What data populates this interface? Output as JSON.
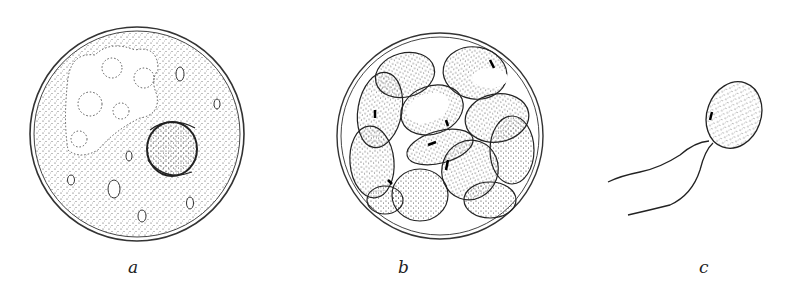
{
  "figure": {
    "panels": [
      {
        "id": "a",
        "label": "a",
        "description": "spherical cyst with granular cytoplasm, irregular dotted region with vacuoles, and a thick-walled nucleus-like body"
      },
      {
        "id": "b",
        "label": "b",
        "description": "cyst containing a cluster of many stippled oval cells"
      },
      {
        "id": "c",
        "label": "c",
        "description": "single oval stippled cell with two long flagella"
      }
    ]
  },
  "colors": {
    "ink": "#2a2a2a",
    "background": "#ffffff"
  }
}
